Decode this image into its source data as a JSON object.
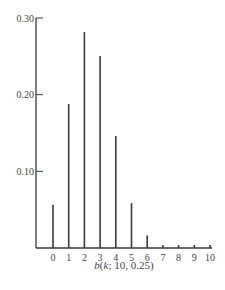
{
  "chart_data": {
    "type": "bar",
    "style": "stem",
    "title": "",
    "xlabel": "b(k; 10, 0.25)",
    "xlabel_parts": {
      "func": "b",
      "open": "(",
      "var": "k",
      "rest": "; 10, 0.25)"
    },
    "ylabel": "",
    "categories": [
      "0",
      "1",
      "2",
      "3",
      "4",
      "5",
      "6",
      "7",
      "8",
      "9",
      "10"
    ],
    "values": [
      0.0563,
      0.1877,
      0.2816,
      0.2503,
      0.146,
      0.0584,
      0.0162,
      0.0031,
      0.0004,
      0.0,
      0.0
    ],
    "ylim": [
      0,
      0.3
    ],
    "yticks": [
      0.1,
      0.2,
      0.3
    ],
    "ytick_labels": [
      "0.10",
      "0.20",
      "0.30"
    ],
    "grid": false,
    "legend": null
  }
}
